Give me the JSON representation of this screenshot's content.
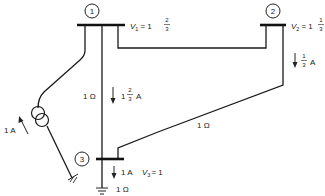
{
  "diagram": {
    "type": "power-system-network",
    "buses": [
      {
        "id": "1",
        "label": "1",
        "voltage_label": "V",
        "voltage_sub": "1",
        "voltage_eq": "= 1",
        "voltage_frac_num": "2",
        "voltage_frac_den": "3"
      },
      {
        "id": "2",
        "label": "2",
        "voltage_label": "V",
        "voltage_sub": "2",
        "voltage_eq": "= 1",
        "voltage_frac_num": "1",
        "voltage_frac_den": "3"
      },
      {
        "id": "3",
        "label": "3",
        "voltage_label": "V",
        "voltage_sub": "3",
        "voltage_eq": "= 1"
      }
    ],
    "lines": [
      {
        "from": "1",
        "to": "3",
        "impedance": "1 Ω",
        "current_whole": "1",
        "current_num": "2",
        "current_den": "3",
        "current_unit": "A"
      },
      {
        "from": "2",
        "to": "3",
        "impedance": "1 Ω",
        "current_num": "1",
        "current_den": "3",
        "current_unit": "A"
      },
      {
        "from": "1",
        "to": "2"
      }
    ],
    "source": {
      "current_label": "1 A"
    },
    "load": {
      "current_label": "1 A",
      "impedance": "1 Ω"
    }
  }
}
